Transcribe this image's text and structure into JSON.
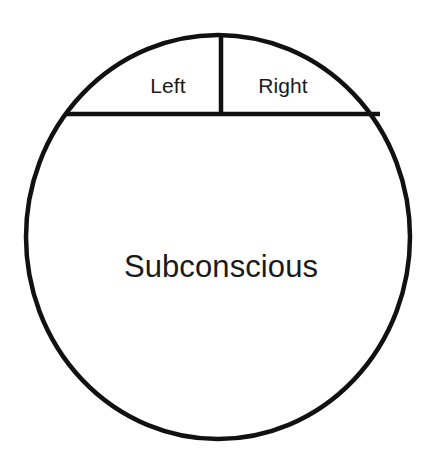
{
  "diagram": {
    "type": "circle-partition-diagram",
    "background_color": "#ffffff",
    "stroke_color": "#111111",
    "text_color": "#1a1a1a",
    "stroke_width": 4.5,
    "circle": {
      "center_x": 218,
      "center_y": 237,
      "radius_x": 192,
      "radius_y": 202
    },
    "divider_horizontal": {
      "y": 114,
      "x_start": 68,
      "x_end": 378
    },
    "divider_vertical": {
      "x": 221,
      "y_start": 35,
      "y_end": 114
    },
    "regions": [
      {
        "id": "left",
        "label": "Left",
        "center_x": 168,
        "center_y": 85,
        "font_size": 21
      },
      {
        "id": "right",
        "label": "Right",
        "center_x": 283,
        "center_y": 85,
        "font_size": 21
      },
      {
        "id": "subconscious",
        "label": "Subconscious",
        "center_x": 221,
        "center_y": 266,
        "font_size": 31
      }
    ]
  }
}
